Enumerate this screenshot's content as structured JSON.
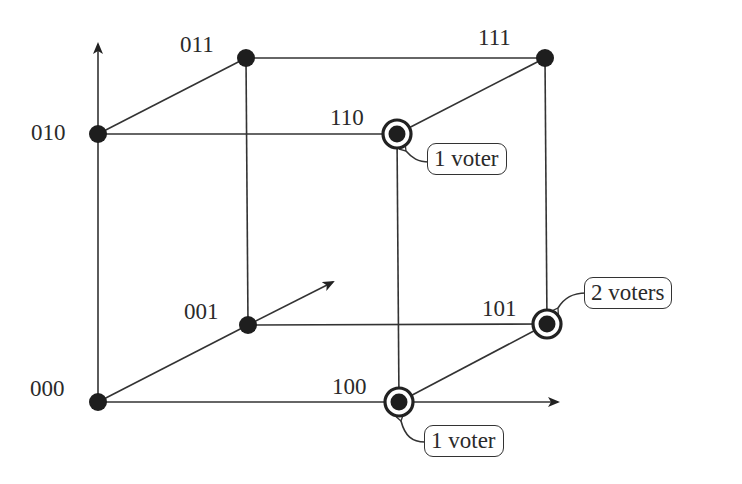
{
  "diagram": {
    "type": "cube-vertex-diagram",
    "vertices": [
      {
        "id": "000",
        "label": "000",
        "x": 98,
        "y": 402,
        "voted": false
      },
      {
        "id": "001",
        "label": "001",
        "x": 248,
        "y": 325,
        "voted": false
      },
      {
        "id": "010",
        "label": "010",
        "x": 98,
        "y": 134,
        "voted": false
      },
      {
        "id": "011",
        "label": "011",
        "x": 246,
        "y": 58,
        "voted": false
      },
      {
        "id": "100",
        "label": "100",
        "x": 399,
        "y": 402,
        "voted": true
      },
      {
        "id": "101",
        "label": "101",
        "x": 547,
        "y": 324,
        "voted": true
      },
      {
        "id": "110",
        "label": "110",
        "x": 397,
        "y": 134,
        "voted": true
      },
      {
        "id": "111",
        "label": "111",
        "x": 545,
        "y": 58,
        "voted": false
      }
    ],
    "edges": [
      [
        "000",
        "100"
      ],
      [
        "000",
        "010"
      ],
      [
        "000",
        "001"
      ],
      [
        "010",
        "110"
      ],
      [
        "010",
        "011"
      ],
      [
        "001",
        "101"
      ],
      [
        "001",
        "011"
      ],
      [
        "100",
        "110"
      ],
      [
        "100",
        "101"
      ],
      [
        "011",
        "111"
      ],
      [
        "110",
        "111"
      ],
      [
        "101",
        "111"
      ]
    ],
    "axes": [
      {
        "name": "x-axis",
        "from": [
          98,
          402
        ],
        "to": [
          560,
          402
        ]
      },
      {
        "name": "y-axis",
        "from": [
          98,
          402
        ],
        "to": [
          98,
          42
        ]
      },
      {
        "name": "z-axis",
        "from": [
          248,
          325
        ],
        "to": [
          335,
          281
        ]
      }
    ],
    "callouts": [
      {
        "vertex": "110",
        "text": "1 voter"
      },
      {
        "vertex": "101",
        "text": "2 voters"
      },
      {
        "vertex": "100",
        "text": "1 voter"
      }
    ]
  },
  "labels": {
    "v000": "000",
    "v001": "001",
    "v010": "010",
    "v011": "011",
    "v100": "100",
    "v101": "101",
    "v110": "110",
    "v111": "111"
  },
  "callouts": {
    "c110": "1 voter",
    "c101": "2 voters",
    "c100": "1 voter"
  },
  "colors": {
    "stroke": "#333333",
    "node": "#1e1e1e",
    "background": "#ffffff"
  }
}
